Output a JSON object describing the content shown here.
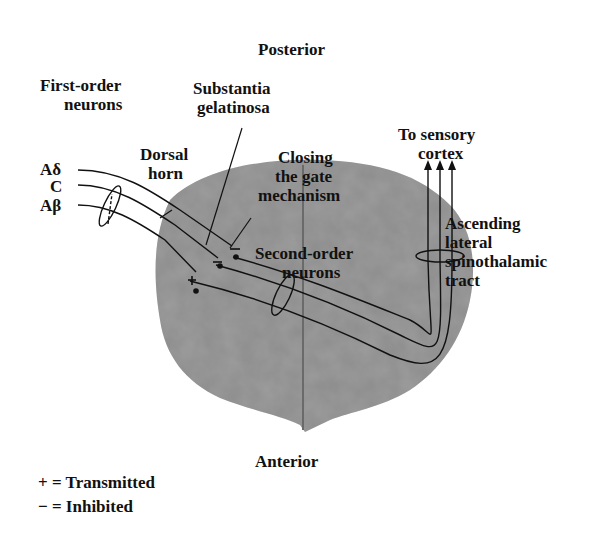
{
  "orientation": {
    "top": "Posterior",
    "bottom": "Anterior"
  },
  "labels": {
    "first_order_1": "First-order",
    "first_order_2": "neurons",
    "substantia_1": "Substantia",
    "substantia_2": "gelatinosa",
    "dorsal_1": "Dorsal",
    "dorsal_2": "horn",
    "closing_1": "Closing",
    "closing_2": "the gate",
    "closing_3": "mechanism",
    "second_order_1": "Second-order",
    "second_order_2": "neurons",
    "to_cortex_1": "To sensory",
    "to_cortex_2": "cortex",
    "ascending_1": "Ascending",
    "ascending_2": "lateral",
    "ascending_3": "spinothalamic",
    "ascending_4": "tract"
  },
  "fibers": [
    "Aδ",
    "C",
    "Aβ"
  ],
  "legend": {
    "plus": "+ = Transmitted",
    "minus": "− = Inhibited"
  },
  "colors": {
    "cord": "#8a8a8a",
    "cord_dark": "#6f6f6f",
    "line": "#111111"
  }
}
